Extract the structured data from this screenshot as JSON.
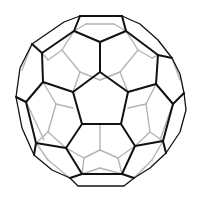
{
  "figure": {
    "subject": "truncated icosahedron wireframe (soccer ball / buckyball)",
    "colors": {
      "background": "#ffffff",
      "front_edges": "#111111",
      "back_edges": "#b4b4b4"
    },
    "center_pentagon": [
      [
        100,
        72
      ],
      [
        128,
        92
      ],
      [
        121,
        124
      ],
      [
        82,
        124
      ],
      [
        73,
        92
      ]
    ],
    "front_edges": [
      [
        [
          100,
          72
        ],
        [
          128,
          92
        ]
      ],
      [
        [
          128,
          92
        ],
        [
          121,
          124
        ]
      ],
      [
        [
          121,
          124
        ],
        [
          82,
          124
        ]
      ],
      [
        [
          82,
          124
        ],
        [
          73,
          92
        ]
      ],
      [
        [
          73,
          92
        ],
        [
          100,
          72
        ]
      ],
      [
        [
          100,
          72
        ],
        [
          100,
          42
        ]
      ],
      [
        [
          128,
          92
        ],
        [
          156,
          84
        ]
      ],
      [
        [
          121,
          124
        ],
        [
          135,
          146
        ]
      ],
      [
        [
          82,
          124
        ],
        [
          66,
          148
        ]
      ],
      [
        [
          73,
          92
        ],
        [
          43,
          82
        ]
      ],
      [
        [
          100,
          42
        ],
        [
          74,
          31
        ]
      ],
      [
        [
          100,
          42
        ],
        [
          126,
          31
        ]
      ],
      [
        [
          74,
          31
        ],
        [
          80,
          16
        ]
      ],
      [
        [
          126,
          31
        ],
        [
          122,
          16
        ]
      ],
      [
        [
          80,
          16
        ],
        [
          122,
          16
        ]
      ],
      [
        [
          74,
          31
        ],
        [
          42,
          53
        ]
      ],
      [
        [
          42,
          53
        ],
        [
          43,
          82
        ]
      ],
      [
        [
          42,
          53
        ],
        [
          32,
          44
        ]
      ],
      [
        [
          126,
          31
        ],
        [
          158,
          55
        ]
      ],
      [
        [
          158,
          55
        ],
        [
          156,
          84
        ]
      ],
      [
        [
          158,
          55
        ],
        [
          172,
          58
        ]
      ],
      [
        [
          156,
          84
        ],
        [
          173,
          104
        ]
      ],
      [
        [
          173,
          104
        ],
        [
          163,
          141
        ]
      ],
      [
        [
          173,
          104
        ],
        [
          184,
          93
        ]
      ],
      [
        [
          43,
          82
        ],
        [
          26,
          102
        ]
      ],
      [
        [
          26,
          102
        ],
        [
          36,
          143
        ]
      ],
      [
        [
          26,
          102
        ],
        [
          16,
          97
        ]
      ],
      [
        [
          66,
          148
        ],
        [
          36,
          143
        ]
      ],
      [
        [
          66,
          148
        ],
        [
          82,
          174
        ]
      ],
      [
        [
          36,
          143
        ],
        [
          34,
          155
        ]
      ],
      [
        [
          135,
          146
        ],
        [
          163,
          141
        ]
      ],
      [
        [
          135,
          146
        ],
        [
          122,
          174
        ]
      ],
      [
        [
          163,
          141
        ],
        [
          166,
          153
        ]
      ],
      [
        [
          82,
          174
        ],
        [
          122,
          174
        ]
      ],
      [
        [
          82,
          174
        ],
        [
          70,
          178
        ]
      ],
      [
        [
          122,
          174
        ],
        [
          134,
          178
        ]
      ]
    ],
    "rim": [
      [
        80,
        16
      ],
      [
        64,
        22
      ],
      [
        32,
        44
      ],
      [
        20,
        68
      ],
      [
        16,
        97
      ],
      [
        22,
        128
      ],
      [
        34,
        155
      ],
      [
        52,
        170
      ],
      [
        70,
        178
      ],
      [
        78,
        186
      ],
      [
        124,
        186
      ],
      [
        134,
        178
      ],
      [
        150,
        168
      ],
      [
        166,
        153
      ],
      [
        180,
        132
      ],
      [
        186,
        110
      ],
      [
        184,
        93
      ],
      [
        180,
        74
      ],
      [
        172,
        58
      ],
      [
        158,
        40
      ],
      [
        140,
        24
      ],
      [
        122,
        16
      ]
    ],
    "back_edges": [
      [
        [
          74,
          31
        ],
        [
          86,
          24
        ]
      ],
      [
        [
          126,
          31
        ],
        [
          114,
          24
        ]
      ],
      [
        [
          86,
          24
        ],
        [
          114,
          24
        ]
      ],
      [
        [
          62,
          50
        ],
        [
          74,
          31
        ]
      ],
      [
        [
          62,
          50
        ],
        [
          80,
          72
        ]
      ],
      [
        [
          80,
          72
        ],
        [
          73,
          92
        ]
      ],
      [
        [
          62,
          50
        ],
        [
          48,
          60
        ]
      ],
      [
        [
          48,
          60
        ],
        [
          42,
          53
        ]
      ],
      [
        [
          138,
          50
        ],
        [
          126,
          31
        ]
      ],
      [
        [
          138,
          50
        ],
        [
          120,
          72
        ]
      ],
      [
        [
          120,
          72
        ],
        [
          128,
          92
        ]
      ],
      [
        [
          138,
          50
        ],
        [
          152,
          58
        ]
      ],
      [
        [
          152,
          58
        ],
        [
          158,
          55
        ]
      ],
      [
        [
          80,
          72
        ],
        [
          100,
          80
        ]
      ],
      [
        [
          120,
          72
        ],
        [
          100,
          80
        ]
      ],
      [
        [
          43,
          82
        ],
        [
          56,
          104
        ]
      ],
      [
        [
          56,
          104
        ],
        [
          48,
          132
        ]
      ],
      [
        [
          56,
          104
        ],
        [
          73,
          108
        ]
      ],
      [
        [
          48,
          132
        ],
        [
          36,
          143
        ]
      ],
      [
        [
          48,
          132
        ],
        [
          66,
          148
        ]
      ],
      [
        [
          156,
          84
        ],
        [
          146,
          104
        ]
      ],
      [
        [
          146,
          104
        ],
        [
          150,
          132
        ]
      ],
      [
        [
          146,
          104
        ],
        [
          128,
          108
        ]
      ],
      [
        [
          150,
          132
        ],
        [
          163,
          141
        ]
      ],
      [
        [
          150,
          132
        ],
        [
          135,
          146
        ]
      ],
      [
        [
          66,
          148
        ],
        [
          84,
          158
        ]
      ],
      [
        [
          135,
          146
        ],
        [
          118,
          158
        ]
      ],
      [
        [
          84,
          158
        ],
        [
          100,
          150
        ]
      ],
      [
        [
          118,
          158
        ],
        [
          100,
          150
        ]
      ],
      [
        [
          100,
          150
        ],
        [
          100,
          124
        ]
      ],
      [
        [
          84,
          158
        ],
        [
          82,
          174
        ]
      ],
      [
        [
          118,
          158
        ],
        [
          122,
          174
        ]
      ],
      [
        [
          26,
          102
        ],
        [
          30,
          110
        ]
      ],
      [
        [
          30,
          110
        ],
        [
          44,
          140
        ]
      ],
      [
        [
          173,
          104
        ],
        [
          170,
          112
        ]
      ],
      [
        [
          170,
          112
        ],
        [
          160,
          140
        ]
      ],
      [
        [
          36,
          143
        ],
        [
          48,
          160
        ]
      ],
      [
        [
          48,
          160
        ],
        [
          70,
          178
        ]
      ],
      [
        [
          163,
          141
        ],
        [
          152,
          160
        ]
      ],
      [
        [
          152,
          160
        ],
        [
          134,
          178
        ]
      ],
      [
        [
          82,
          174
        ],
        [
          100,
          168
        ]
      ],
      [
        [
          122,
          174
        ],
        [
          100,
          168
        ]
      ],
      [
        [
          172,
          58
        ],
        [
          180,
          80
        ]
      ],
      [
        [
          32,
          44
        ],
        [
          22,
          70
        ]
      ]
    ]
  }
}
